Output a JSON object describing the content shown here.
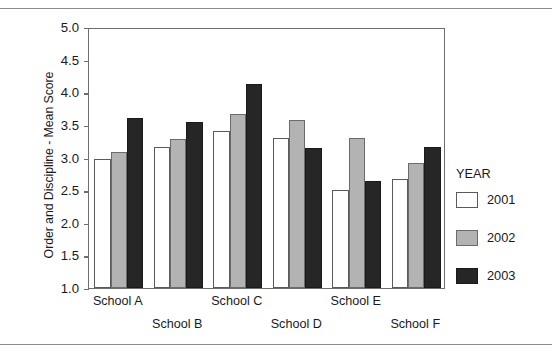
{
  "chart_data": {
    "type": "bar",
    "title": "",
    "xlabel": "",
    "ylabel": "Order and Discipline - Mean Score",
    "ylim": [
      1.0,
      5.0
    ],
    "ytick_labels": [
      "5.0",
      "4.5",
      "4.0",
      "3.5",
      "3.0",
      "2.5",
      "2.0",
      "1.5",
      "1.0"
    ],
    "ytick_values": [
      5.0,
      4.5,
      4.0,
      3.5,
      3.0,
      2.5,
      2.0,
      1.5,
      1.0
    ],
    "grid": false,
    "legend_position": "right",
    "legend_title": "YEAR",
    "categories": [
      "School A",
      "School B",
      "School C",
      "School D",
      "School E",
      "School F"
    ],
    "series": [
      {
        "name": "2001",
        "color": "#ffffff",
        "values": [
          2.98,
          3.16,
          3.41,
          3.3,
          2.5,
          2.67
        ]
      },
      {
        "name": "2002",
        "color": "#b3b3b3",
        "values": [
          3.09,
          3.29,
          3.66,
          3.57,
          3.3,
          2.91
        ]
      },
      {
        "name": "2003",
        "color": "#262626",
        "values": [
          3.61,
          3.54,
          4.13,
          3.15,
          2.64,
          3.16
        ]
      }
    ]
  },
  "axes": {
    "y_title": "Order and Discipline - Mean Score"
  },
  "legend": {
    "title": "YEAR",
    "entries": [
      {
        "label": "2001",
        "swatch": "white"
      },
      {
        "label": "2002",
        "swatch": "gray"
      },
      {
        "label": "2003",
        "swatch": "dark"
      }
    ]
  },
  "colors": {
    "series_2001": "#ffffff",
    "series_2002": "#b3b3b3",
    "series_2003": "#262626",
    "axis": "#6e6e6e",
    "rule": "#8c8c8c",
    "text": "#1a1a1a"
  }
}
